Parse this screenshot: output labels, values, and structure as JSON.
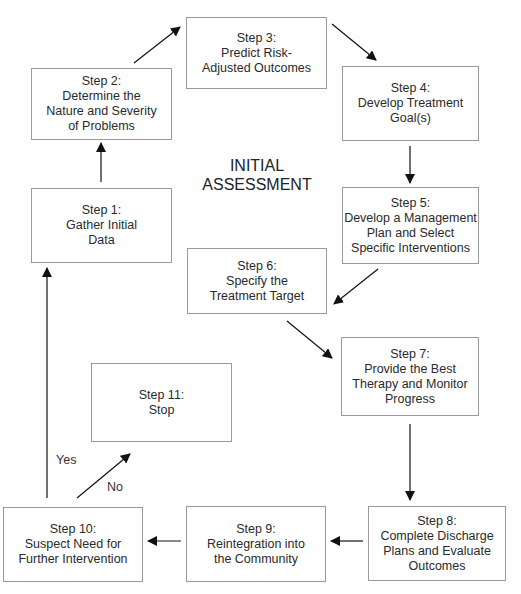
{
  "diagram": {
    "center_title": "INITIAL\nASSESSMENT",
    "steps": [
      {
        "id": 1,
        "label": "Step 1:\nGather Initial\nData"
      },
      {
        "id": 2,
        "label": "Step 2:\nDetermine the\nNature and Severity\nof Problems"
      },
      {
        "id": 3,
        "label": "Step 3:\nPredict Risk-\nAdjusted Outcomes"
      },
      {
        "id": 4,
        "label": "Step 4:\nDevelop Treatment\nGoal(s)"
      },
      {
        "id": 5,
        "label": "Step 5:\nDevelop a Management\nPlan and Select\nSpecific Interventions"
      },
      {
        "id": 6,
        "label": "Step 6:\nSpecify the\nTreatment Target"
      },
      {
        "id": 7,
        "label": "Step 7:\nProvide the Best\nTherapy and Monitor\nProgress"
      },
      {
        "id": 8,
        "label": "Step 8:\nComplete Discharge\nPlans and Evaluate\nOutcomes"
      },
      {
        "id": 9,
        "label": "Step 9:\nReintegration into\nthe Community"
      },
      {
        "id": 10,
        "label": "Step 10:\nSuspect Need for\nFurther Intervention"
      },
      {
        "id": 11,
        "label": "Step 11:\nStop"
      }
    ],
    "edge_labels": {
      "yes": "Yes",
      "no": "No"
    },
    "edges": [
      {
        "from": 1,
        "to": 2
      },
      {
        "from": 2,
        "to": 3
      },
      {
        "from": 3,
        "to": 4
      },
      {
        "from": 4,
        "to": 5
      },
      {
        "from": 5,
        "to": 6
      },
      {
        "from": 6,
        "to": 7
      },
      {
        "from": 7,
        "to": 8
      },
      {
        "from": 8,
        "to": 9
      },
      {
        "from": 9,
        "to": 10
      },
      {
        "from": 10,
        "to": 1,
        "label": "Yes"
      },
      {
        "from": 10,
        "to": 11,
        "label": "No"
      }
    ]
  }
}
